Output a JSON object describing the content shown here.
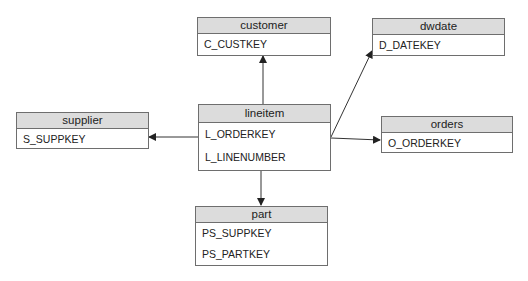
{
  "entities": {
    "customer": {
      "title": "customer",
      "attributes": [
        "C_CUSTKEY"
      ]
    },
    "dwdate": {
      "title": "dwdate",
      "attributes": [
        "D_DATEKEY"
      ]
    },
    "supplier": {
      "title": "supplier",
      "attributes": [
        "S_SUPPKEY"
      ]
    },
    "lineitem": {
      "title": "lineitem",
      "attributes": [
        "L_ORDERKEY",
        "L_LINENUMBER"
      ]
    },
    "orders": {
      "title": "orders",
      "attributes": [
        "O_ORDERKEY"
      ]
    },
    "part": {
      "title": "part",
      "attributes": [
        "PS_SUPPKEY",
        "PS_PARTKEY"
      ]
    }
  },
  "relationships": [
    {
      "from": "lineitem",
      "to": "customer"
    },
    {
      "from": "lineitem",
      "to": "dwdate"
    },
    {
      "from": "lineitem",
      "to": "supplier"
    },
    {
      "from": "lineitem",
      "to": "orders"
    },
    {
      "from": "lineitem",
      "to": "part"
    }
  ],
  "colors": {
    "header_bg": "#dcdcdc",
    "border": "#6e6e6e",
    "line": "#333333"
  }
}
